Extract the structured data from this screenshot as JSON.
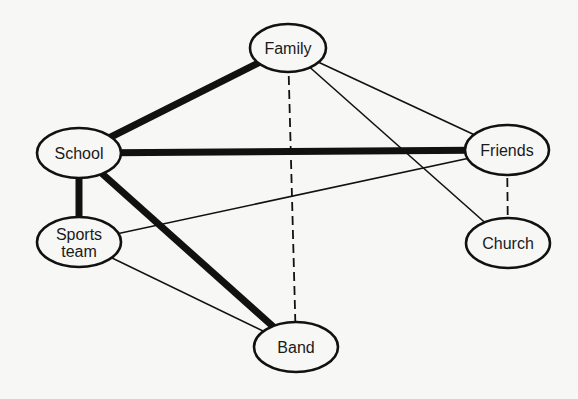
{
  "diagram": {
    "type": "network",
    "background": "#f7f7f5",
    "stroke_color": "#111111",
    "nodes": [
      {
        "id": "family",
        "label_lines": [
          "Family"
        ],
        "cx": 288,
        "cy": 48,
        "rx": 38,
        "ry": 24
      },
      {
        "id": "school",
        "label_lines": [
          "School"
        ],
        "cx": 79,
        "cy": 153,
        "rx": 42,
        "ry": 25
      },
      {
        "id": "friends",
        "label_lines": [
          "Friends"
        ],
        "cx": 507,
        "cy": 150,
        "rx": 42,
        "ry": 25
      },
      {
        "id": "sports",
        "label_lines": [
          "Sports",
          "team"
        ],
        "cx": 79,
        "cy": 242,
        "rx": 42,
        "ry": 25
      },
      {
        "id": "church",
        "label_lines": [
          "Church"
        ],
        "cx": 508,
        "cy": 243,
        "rx": 42,
        "ry": 25
      },
      {
        "id": "band",
        "label_lines": [
          "Band"
        ],
        "cx": 296,
        "cy": 347,
        "rx": 42,
        "ry": 25
      }
    ],
    "edges": [
      {
        "from": "school",
        "to": "family",
        "style": "thick"
      },
      {
        "from": "school",
        "to": "friends",
        "style": "thick"
      },
      {
        "from": "school",
        "to": "sports",
        "style": "thick"
      },
      {
        "from": "school",
        "to": "band",
        "style": "thick"
      },
      {
        "from": "family",
        "to": "friends",
        "style": "thin"
      },
      {
        "from": "family",
        "to": "church",
        "style": "thin"
      },
      {
        "from": "friends",
        "to": "sports",
        "style": "thin"
      },
      {
        "from": "sports",
        "to": "band",
        "style": "thin"
      },
      {
        "from": "family",
        "to": "band",
        "style": "dashed"
      },
      {
        "from": "friends",
        "to": "church",
        "style": "dashed"
      }
    ],
    "edge_styles": {
      "thick": {
        "width": 7,
        "dash": ""
      },
      "thin": {
        "width": 1.6,
        "dash": ""
      },
      "dashed": {
        "width": 1.8,
        "dash": "9,5"
      }
    },
    "node_stroke_width": 2.6
  }
}
